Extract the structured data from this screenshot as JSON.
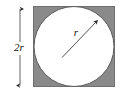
{
  "figure": {
    "type": "geometry-diagram",
    "canvas": {
      "width": 124,
      "height": 96,
      "background": "#ffffff"
    },
    "labels": {
      "side_label": "2r",
      "radius_label": "r"
    },
    "colors": {
      "square_fill": "#8a8a8a",
      "square_stroke": "#6f6f6f",
      "circle_fill": "#ffffff",
      "circle_stroke": "#5a5a5a",
      "line_color": "#3a3a3a",
      "text_color": "#111111",
      "background": "#ffffff"
    },
    "shapes": {
      "square": {
        "x": 33,
        "y": 6,
        "width": 82,
        "height": 81
      },
      "circle": {
        "cx": 74,
        "cy": 46.5,
        "r": 40.5
      },
      "radius_arrow": {
        "x1": 62,
        "y1": 57,
        "x2": 99,
        "y2": 19
      },
      "dimension_line": {
        "x": 20,
        "y1": 8,
        "y2": 87
      }
    },
    "label_positions": {
      "side_label": {
        "x": 19,
        "y": 51
      },
      "radius_label": {
        "x": 76,
        "y": 36
      }
    }
  }
}
